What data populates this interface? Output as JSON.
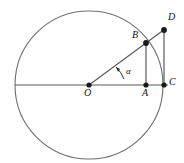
{
  "figure": {
    "type": "geometry-diagram",
    "background_color": "#ffffff",
    "stroke_color": "#6e6e6e",
    "line_color": "#5a5a5a",
    "point_color": "#1a1a1a",
    "label_color": "#111111",
    "circle": {
      "center_label": "O",
      "center_x": 89,
      "center_y": 85,
      "radius": 74
    },
    "points": [
      {
        "id": "O",
        "label": "O",
        "x": 89,
        "y": 85,
        "label_x": 85,
        "label_y": 89,
        "dot": true
      },
      {
        "id": "A",
        "label": "A",
        "x": 146,
        "y": 85,
        "label_x": 143,
        "label_y": 89,
        "dot": true
      },
      {
        "id": "B",
        "label": "B",
        "x": 146,
        "y": 43,
        "label_x": 133,
        "label_y": 31,
        "dot": true
      },
      {
        "id": "C",
        "label": "C",
        "x": 164,
        "y": 85,
        "label_x": 169,
        "label_y": 78,
        "dot": true
      },
      {
        "id": "D",
        "label": "D",
        "x": 164,
        "y": 30,
        "label_x": 169,
        "label_y": 13,
        "dot": true
      }
    ],
    "segments": [
      {
        "id": "OC",
        "from": "O",
        "to": "C",
        "note": "horizontal radius through A to C"
      },
      {
        "id": "OD",
        "from": "O",
        "to": "D",
        "note": "ray from center through B to D"
      },
      {
        "id": "BA",
        "from": "B",
        "to": "A",
        "note": "vertical from B down to A"
      },
      {
        "id": "DC",
        "from": "D",
        "to": "C",
        "note": "vertical tangent from D down to C"
      },
      {
        "id": "OLeft",
        "from": "O",
        "to": "circle-left",
        "note": "horizontal radius to left edge of circle"
      }
    ],
    "angle": {
      "label": "α",
      "vertex": "O",
      "label_x": 126,
      "label_y": 68,
      "arc_radius": 32,
      "arrow": true
    }
  }
}
